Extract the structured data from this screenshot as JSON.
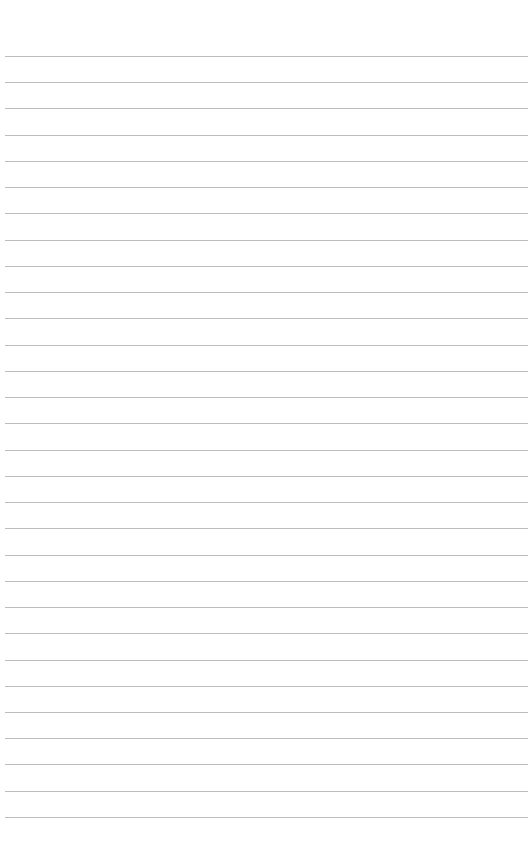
{
  "page": {
    "type": "lined-paper",
    "background": "#ffffff",
    "line_color": "#bdbdbd",
    "line_count": 30,
    "first_line_y": 56,
    "line_spacing": 26.24,
    "line_left": 5,
    "line_right": 528
  }
}
